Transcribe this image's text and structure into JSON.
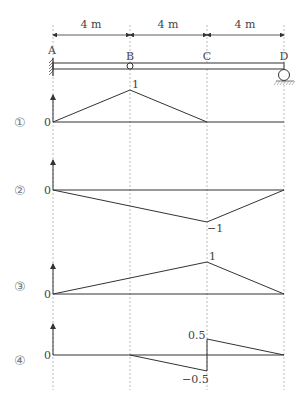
{
  "beam": {
    "span_labels": [
      "4 m",
      "4 m",
      "4 m"
    ],
    "points": [
      "A",
      "B",
      "C",
      "D"
    ],
    "supports": {
      "A": "fixed",
      "B": "hinge",
      "D": "roller"
    }
  },
  "diagrams": [
    {
      "label": "①",
      "zero": "0",
      "peak_label": "1",
      "peak_at": "B"
    },
    {
      "label": "②",
      "zero": "0",
      "peak_label": "−1",
      "peak_at": "C"
    },
    {
      "label": "③",
      "zero": "0",
      "peak_label": "1",
      "peak_at": "C"
    },
    {
      "label": "④",
      "zero": "0",
      "upper_label": "0.5",
      "lower_label": "−0.5",
      "jump_at": "C"
    }
  ],
  "colors": {
    "line": "#333333",
    "dashed": "#999999",
    "text": "#444444"
  }
}
